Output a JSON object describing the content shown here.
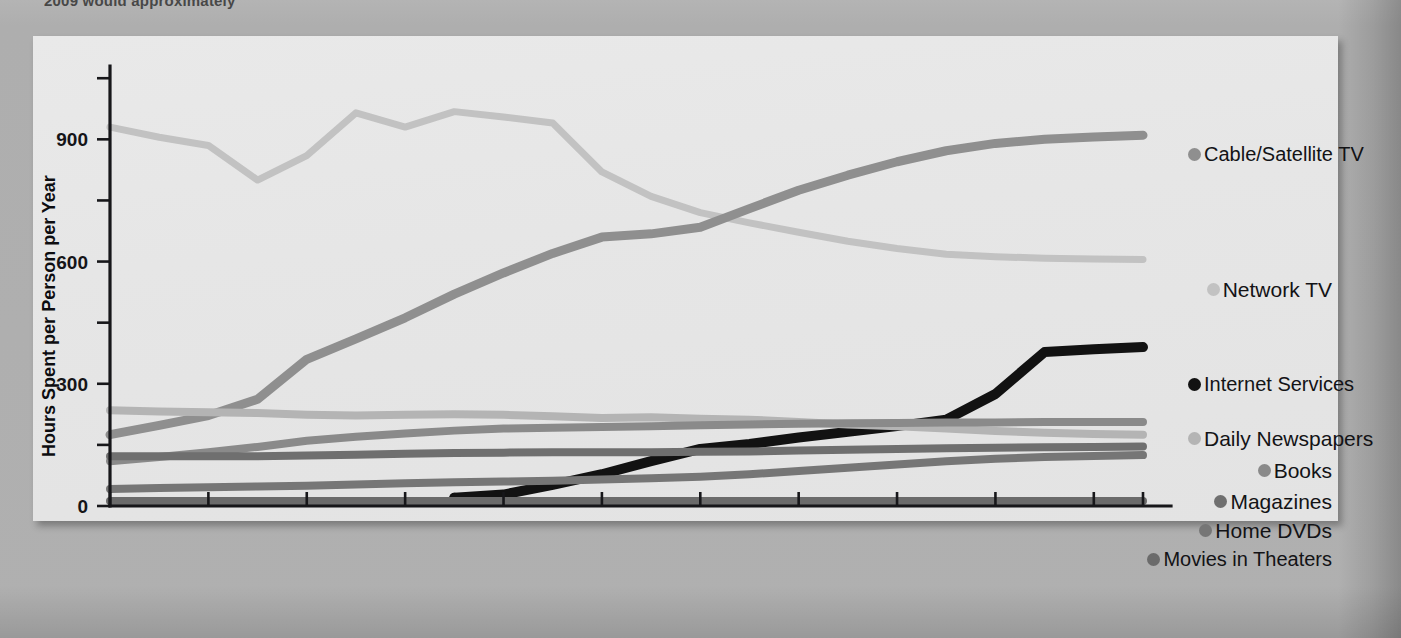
{
  "page": {
    "top_cropped_text": "2009 would approximately"
  },
  "figure": {
    "background": "#e7e7e7"
  },
  "chart_data": {
    "type": "line",
    "title": "",
    "xlabel": "Year",
    "ylabel": "Hours Spent per Person per Year",
    "x": [
      1988,
      1989,
      1990,
      1991,
      1992,
      1993,
      1994,
      1995,
      1996,
      1997,
      1998,
      1999,
      2000,
      2001,
      2002,
      2003,
      2004,
      2005,
      2006,
      2007,
      2008,
      2009
    ],
    "xlim": [
      1988,
      2009
    ],
    "ylim": [
      0,
      1080
    ],
    "yticks_major": [
      0,
      300,
      600,
      900
    ],
    "yticks_minor": [
      150,
      450,
      750,
      1050
    ],
    "xtick_labels": [
      "1988",
      "1990",
      "1992",
      "1994",
      "1996",
      "1998",
      "2000",
      "2002",
      "2004",
      "2006",
      "2008",
      "2009"
    ],
    "grid": false,
    "legend_position": "right",
    "series": [
      {
        "name": "Network TV",
        "color": "#c2c2c2",
        "width": 7,
        "values": [
          930,
          905,
          885,
          800,
          860,
          965,
          930,
          968,
          955,
          940,
          820,
          760,
          720,
          695,
          672,
          650,
          632,
          618,
          612,
          608,
          606,
          605
        ]
      },
      {
        "name": "Cable/Satellite TV",
        "color": "#8f8f8f",
        "width": 9,
        "values": [
          175,
          198,
          222,
          262,
          360,
          410,
          462,
          520,
          572,
          620,
          660,
          668,
          684,
          730,
          775,
          812,
          845,
          872,
          890,
          900,
          906,
          910
        ]
      },
      {
        "name": "Internet Services",
        "color": "#121212",
        "width": 10,
        "values": [
          null,
          null,
          null,
          null,
          null,
          null,
          null,
          20,
          28,
          52,
          78,
          110,
          140,
          152,
          168,
          182,
          196,
          212,
          275,
          378,
          385,
          390
        ]
      },
      {
        "name": "Daily Newspapers",
        "color": "#b4b4b4",
        "width": 8,
        "values": [
          235,
          232,
          230,
          228,
          224,
          222,
          224,
          225,
          224,
          220,
          216,
          218,
          214,
          212,
          206,
          200,
          196,
          190,
          184,
          180,
          177,
          175
        ]
      },
      {
        "name": "Books",
        "color": "#8a8a8a",
        "width": 8,
        "values": [
          110,
          120,
          132,
          145,
          160,
          170,
          178,
          185,
          190,
          192,
          194,
          196,
          198,
          200,
          202,
          203,
          204,
          205,
          205,
          206,
          206,
          206
        ]
      },
      {
        "name": "Magazines",
        "color": "#6f6f6f",
        "width": 8,
        "values": [
          122,
          122,
          122,
          122,
          124,
          126,
          128,
          130,
          131,
          132,
          132,
          132,
          133,
          134,
          136,
          138,
          140,
          142,
          143,
          144,
          145,
          146
        ]
      },
      {
        "name": "Home DVDs",
        "color": "#767676",
        "width": 8,
        "values": [
          42,
          44,
          46,
          48,
          50,
          53,
          56,
          58,
          60,
          62,
          65,
          68,
          72,
          78,
          86,
          94,
          102,
          110,
          116,
          120,
          123,
          125
        ]
      },
      {
        "name": "Movies in Theaters",
        "color": "#6b6b6b",
        "width": 8,
        "values": [
          12,
          12,
          12,
          12,
          12,
          12,
          12,
          12,
          12,
          12,
          12,
          12,
          12,
          12,
          12,
          12,
          12,
          12,
          12,
          12,
          12,
          12
        ]
      }
    ]
  },
  "legend": [
    {
      "label": "Cable/Satellite TV",
      "color": "#8f8f8f",
      "top": 108,
      "align": "left"
    },
    {
      "label": "Network TV",
      "color": "#c2c2c2",
      "top": 243,
      "align": "right"
    },
    {
      "label": "Internet Services",
      "color": "#121212",
      "top": 338,
      "align": "left"
    },
    {
      "label": "Daily Newspapers",
      "color": "#b4b4b4",
      "top": 392,
      "align": "left"
    },
    {
      "label": "Books",
      "color": "#8a8a8a",
      "top": 424,
      "align": "right"
    },
    {
      "label": "Magazines",
      "color": "#6f6f6f",
      "top": 455,
      "align": "right"
    },
    {
      "label": "Home DVDs",
      "color": "#767676",
      "top": 484,
      "align": "right"
    },
    {
      "label": "Movies in Theaters",
      "color": "#6b6b6b",
      "top": 513,
      "align": "right"
    }
  ]
}
